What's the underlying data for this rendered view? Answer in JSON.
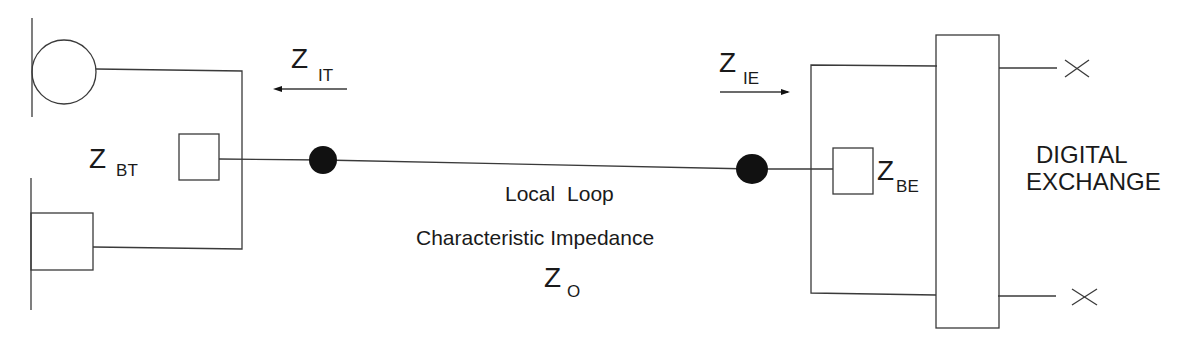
{
  "diagram": {
    "type": "circuit-block-diagram",
    "labels": {
      "z_it": {
        "main": "Z",
        "sub": "IT"
      },
      "z_ie": {
        "main": "Z",
        "sub": "IE"
      },
      "z_bt": {
        "main": "Z",
        "sub": "BT"
      },
      "z_be": {
        "main": "Z",
        "sub": "BE"
      },
      "z_o": {
        "main": "Z",
        "sub": "O"
      },
      "local_loop": "Local  Loop",
      "characteristic_impedance": "Characteristic Impedance",
      "exchange_line1": "DIGITAL",
      "exchange_line2": "EXCHANGE"
    },
    "arrows": [
      {
        "label": "Z IT",
        "direction": "left"
      },
      {
        "label": "Z IE",
        "direction": "right"
      }
    ],
    "nodes": [
      {
        "id": "terminal-dot",
        "kind": "junction"
      },
      {
        "id": "exchange-dot",
        "kind": "junction"
      }
    ],
    "terminations": [
      "x-top",
      "x-bottom"
    ],
    "colors": {
      "stroke": "#3a3a3a",
      "fill": "#111111",
      "background": "#ffffff"
    }
  }
}
